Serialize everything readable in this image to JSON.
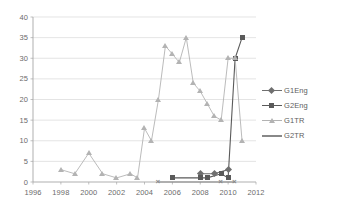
{
  "chart_data": {
    "type": "line",
    "title": "",
    "xlabel": "",
    "ylabel": "",
    "xlim": [
      1996,
      2012
    ],
    "ylim": [
      0,
      40
    ],
    "yticks": [
      0,
      5,
      10,
      15,
      20,
      25,
      30,
      35,
      40
    ],
    "xticks": [
      1996,
      1998,
      2000,
      2002,
      2004,
      2006,
      2008,
      2010,
      2012
    ],
    "grid": true,
    "legend_position": "right",
    "series": [
      {
        "name": "G1Eng",
        "marker": "diamond",
        "color": "#6f6f6f",
        "x": [
          2008,
          2009,
          2010
        ],
        "values": [
          2,
          2,
          3
        ]
      },
      {
        "name": "G2Eng",
        "marker": "square",
        "color": "#5a5a5a",
        "x": [
          2006,
          2008,
          2008.5,
          2009.5,
          2010,
          2010.5,
          2011
        ],
        "values": [
          1,
          1,
          1,
          2,
          1,
          30,
          35
        ]
      },
      {
        "name": "G1TR",
        "marker": "triangle",
        "color": "#b3b3b3",
        "x": [
          1998,
          1999,
          2000,
          2001,
          2002,
          2003,
          2003.5,
          2004,
          2004.5,
          2005,
          2005.5,
          2006,
          2006.5,
          2007,
          2007.5,
          2008,
          2008.5,
          2009,
          2009.5,
          2010,
          2010.5,
          2011
        ],
        "values": [
          3,
          2,
          7,
          2,
          1,
          2,
          1,
          13,
          10,
          20,
          33,
          31,
          29,
          35,
          24,
          22,
          19,
          16,
          15,
          30,
          30,
          10
        ]
      },
      {
        "name": "G2TR",
        "marker": "x",
        "color": "#888888",
        "x": [
          2005,
          2009.5,
          2010.5
        ],
        "values": [
          0,
          0,
          0
        ]
      }
    ]
  },
  "legend": {
    "items": [
      {
        "label": "G1Eng"
      },
      {
        "label": "G2Eng"
      },
      {
        "label": "G1TR"
      },
      {
        "label": "G2TR"
      }
    ]
  },
  "axes": {
    "y_ticks": [
      "40",
      "35",
      "30",
      "25",
      "20",
      "15",
      "10",
      "5",
      "0"
    ],
    "x_ticks": [
      "1996",
      "1998",
      "2000",
      "2002",
      "2004",
      "2006",
      "2008",
      "2010",
      "2012"
    ]
  },
  "colors": {
    "grid": "#d9d9d9",
    "axis": "#a6a6a6",
    "text": "#6b6b6b",
    "g1eng": "#6f6f6f",
    "g2eng": "#5a5a5a",
    "g1tr": "#b3b3b3",
    "g2tr": "#888888"
  }
}
